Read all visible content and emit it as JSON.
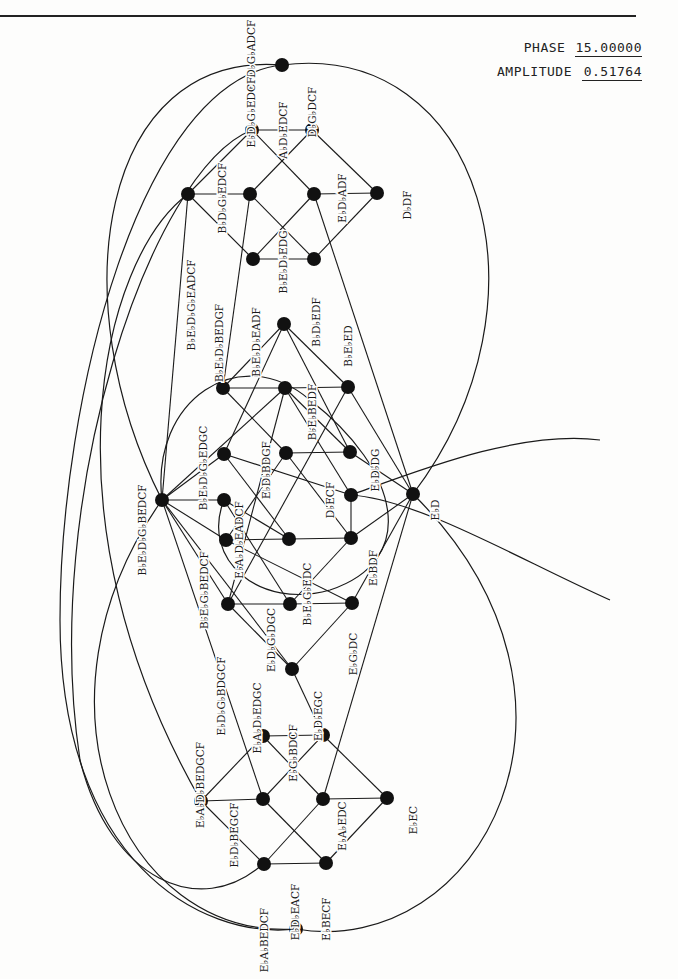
{
  "header": {
    "phase_label": "PHASE",
    "phase_value": "15.00000",
    "amplitude_label": "AMPLITUDE",
    "amplitude_value": "0.51764"
  },
  "diagram": {
    "title": "",
    "colors": {
      "ink": "#1a1a1a",
      "node": "#111111",
      "paper": "#fdfdfc"
    },
    "node_radius": 7,
    "nodes": [
      {
        "id": "T0",
        "x": 282,
        "y": 65
      },
      {
        "id": "T1",
        "x": 252,
        "y": 130
      },
      {
        "id": "T2",
        "x": 312,
        "y": 130
      },
      {
        "id": "T3",
        "x": 188,
        "y": 194
      },
      {
        "id": "T4",
        "x": 250,
        "y": 194
      },
      {
        "id": "T5",
        "x": 314,
        "y": 194
      },
      {
        "id": "T6",
        "x": 377,
        "y": 193
      },
      {
        "id": "T7",
        "x": 253,
        "y": 259
      },
      {
        "id": "T8",
        "x": 314,
        "y": 259
      },
      {
        "id": "M0",
        "x": 284,
        "y": 324
      },
      {
        "id": "M1",
        "x": 223,
        "y": 388
      },
      {
        "id": "M2",
        "x": 285,
        "y": 388
      },
      {
        "id": "M3",
        "x": 348,
        "y": 387
      },
      {
        "id": "M4",
        "x": 224,
        "y": 454
      },
      {
        "id": "M5",
        "x": 286,
        "y": 453
      },
      {
        "id": "M6",
        "x": 350,
        "y": 452
      },
      {
        "id": "L",
        "x": 162,
        "y": 500
      },
      {
        "id": "M7",
        "x": 224,
        "y": 500
      },
      {
        "id": "M8",
        "x": 351,
        "y": 495
      },
      {
        "id": "R",
        "x": 413,
        "y": 494
      },
      {
        "id": "M9",
        "x": 226,
        "y": 540
      },
      {
        "id": "M10",
        "x": 289,
        "y": 539
      },
      {
        "id": "M11",
        "x": 351,
        "y": 538
      },
      {
        "id": "M12",
        "x": 228,
        "y": 604
      },
      {
        "id": "M13",
        "x": 290,
        "y": 604
      },
      {
        "id": "M14",
        "x": 352,
        "y": 603
      },
      {
        "id": "M15",
        "x": 292,
        "y": 669
      },
      {
        "id": "B0",
        "x": 263,
        "y": 736
      },
      {
        "id": "B1",
        "x": 323,
        "y": 735
      },
      {
        "id": "B2",
        "x": 201,
        "y": 801
      },
      {
        "id": "B3",
        "x": 263,
        "y": 799
      },
      {
        "id": "B4",
        "x": 323,
        "y": 799
      },
      {
        "id": "B5",
        "x": 387,
        "y": 798
      },
      {
        "id": "B6",
        "x": 264,
        "y": 864
      },
      {
        "id": "B7",
        "x": 326,
        "y": 863
      },
      {
        "id": "B8",
        "x": 296,
        "y": 929
      }
    ],
    "edges": [
      [
        "T1",
        "T2"
      ],
      [
        "T1",
        "T3"
      ],
      [
        "T1",
        "T5"
      ],
      [
        "T2",
        "T4"
      ],
      [
        "T2",
        "T6"
      ],
      [
        "T3",
        "T4"
      ],
      [
        "T3",
        "T7"
      ],
      [
        "T4",
        "T8"
      ],
      [
        "T5",
        "T6"
      ],
      [
        "T5",
        "T7"
      ],
      [
        "T6",
        "T8"
      ],
      [
        "T7",
        "T8"
      ],
      [
        "T4",
        "M1"
      ],
      [
        "T5",
        "R"
      ],
      [
        "T3",
        "L"
      ],
      [
        "M0",
        "M1"
      ],
      [
        "M0",
        "M3"
      ],
      [
        "M0",
        "M4"
      ],
      [
        "M0",
        "M6"
      ],
      [
        "M1",
        "M2"
      ],
      [
        "M1",
        "M5"
      ],
      [
        "M2",
        "M3"
      ],
      [
        "M2",
        "M6"
      ],
      [
        "M2",
        "M8"
      ],
      [
        "M3",
        "R"
      ],
      [
        "M3",
        "M12"
      ],
      [
        "M4",
        "L"
      ],
      [
        "M4",
        "M8"
      ],
      [
        "M4",
        "M10"
      ],
      [
        "M5",
        "M6"
      ],
      [
        "M5",
        "M9"
      ],
      [
        "M5",
        "M11"
      ],
      [
        "M6",
        "R"
      ],
      [
        "M7",
        "L"
      ],
      [
        "M7",
        "M10"
      ],
      [
        "M7",
        "M13"
      ],
      [
        "M8",
        "M11"
      ],
      [
        "M9",
        "L"
      ],
      [
        "M9",
        "M10"
      ],
      [
        "M9",
        "M14"
      ],
      [
        "M10",
        "M11"
      ],
      [
        "M11",
        "R"
      ],
      [
        "M11",
        "M13"
      ],
      [
        "M12",
        "M13"
      ],
      [
        "M12",
        "M15"
      ],
      [
        "M12",
        "M2"
      ],
      [
        "M13",
        "M14"
      ],
      [
        "M14",
        "M15"
      ],
      [
        "M14",
        "R"
      ],
      [
        "L",
        "M12"
      ],
      [
        "L",
        "M15"
      ],
      [
        "L",
        "M2"
      ],
      [
        "M15",
        "B1"
      ],
      [
        "L",
        "B3"
      ],
      [
        "R",
        "B4"
      ],
      [
        "B0",
        "B1"
      ],
      [
        "B0",
        "B2"
      ],
      [
        "B0",
        "B4"
      ],
      [
        "B1",
        "B3"
      ],
      [
        "B1",
        "B5"
      ],
      [
        "B2",
        "B3"
      ],
      [
        "B2",
        "B6"
      ],
      [
        "B3",
        "B7"
      ],
      [
        "B4",
        "B5"
      ],
      [
        "B4",
        "B6"
      ],
      [
        "B5",
        "B7"
      ],
      [
        "B6",
        "B7"
      ]
    ],
    "arcs": [
      {
        "d": "M 282 65 C 480 40, 560 300, 413 494"
      },
      {
        "d": "M 282 65 C 100 50, 60 300, 162 500"
      },
      {
        "d": "M 282 65 C 140 80, 60 400, 60 620 C 60 860, 200 940, 296 929"
      },
      {
        "d": "M 296 929 C 480 960, 620 700, 413 494"
      },
      {
        "d": "M 296 929 C 120 940, 20 700, 162 500"
      },
      {
        "d": "M 252 130 C 150 170, 40 500, 80 760 C 110 880, 200 920, 263 864"
      },
      {
        "d": "M 188 194 C 100 260, 40 520, 201 801"
      },
      {
        "d": "M 162 500 C 150 400, 240 340, 310 400 C 400 470, 420 560, 330 590 C 260 610, 200 560, 224 500"
      },
      {
        "d": "M 351 495 C 420 470, 520 430, 600 440"
      },
      {
        "d": "M 351 495 C 420 500, 520 560, 610 600"
      }
    ],
    "labels": [
      {
        "text": "E♭D♭G♭ADCF",
        "x": 255,
        "y": 55,
        "rot": -90
      },
      {
        "text": "E♭D♭G♭EDCF",
        "x": 255,
        "y": 112,
        "rot": -90
      },
      {
        "text": "A♭D♭EDCF",
        "x": 287,
        "y": 130,
        "rot": -90
      },
      {
        "text": "D♭G♭DCF",
        "x": 316,
        "y": 112,
        "rot": -90
      },
      {
        "text": "B♭D♭G♭EDCF",
        "x": 226,
        "y": 198,
        "rot": -90
      },
      {
        "text": "E♭D♭ADF",
        "x": 346,
        "y": 198,
        "rot": -90
      },
      {
        "text": "D♭DF",
        "x": 411,
        "y": 205,
        "rot": -90
      },
      {
        "text": "B♭E♭D♭G♭EADCF",
        "x": 195,
        "y": 305,
        "rot": -90
      },
      {
        "text": "B♭E♭D♭EDG",
        "x": 287,
        "y": 262,
        "rot": -90
      },
      {
        "text": "B♭E♭D♭BEDGF",
        "x": 223,
        "y": 343,
        "rot": -90
      },
      {
        "text": "B♭E♭D♭EADF",
        "x": 260,
        "y": 342,
        "rot": -90
      },
      {
        "text": "B♭D♭EDF",
        "x": 320,
        "y": 322,
        "rot": -90
      },
      {
        "text": "B♭E♭ED",
        "x": 352,
        "y": 346,
        "rot": -90
      },
      {
        "text": "B♭E♭BEDF",
        "x": 316,
        "y": 412,
        "rot": -90
      },
      {
        "text": "B♭E♭D♭G♭EDGC",
        "x": 207,
        "y": 468,
        "rot": -90
      },
      {
        "text": "E♭D♭BDGF",
        "x": 270,
        "y": 470,
        "rot": -90
      },
      {
        "text": "E♭D♭DG",
        "x": 379,
        "y": 470,
        "rot": -90
      },
      {
        "text": "B♭E♭D♭G♭BEDCF",
        "x": 146,
        "y": 530,
        "rot": -90
      },
      {
        "text": "E♭A♭D♭EADCF",
        "x": 243,
        "y": 540,
        "rot": -90
      },
      {
        "text": "D♭ECF",
        "x": 334,
        "y": 500,
        "rot": -90
      },
      {
        "text": "E♭D",
        "x": 439,
        "y": 510,
        "rot": -90
      },
      {
        "text": "B♭E♭G♭BEDCF",
        "x": 208,
        "y": 590,
        "rot": -90
      },
      {
        "text": "B♭E♭G♭EDC",
        "x": 311,
        "y": 594,
        "rot": -90
      },
      {
        "text": "E♭BDF",
        "x": 377,
        "y": 568,
        "rot": -90
      },
      {
        "text": "E♭D♭G♭DGC",
        "x": 275,
        "y": 640,
        "rot": -90
      },
      {
        "text": "E♭G♭DC",
        "x": 357,
        "y": 654,
        "rot": -90
      },
      {
        "text": "E♭D♭G♭BDGCF",
        "x": 225,
        "y": 696,
        "rot": -90
      },
      {
        "text": "E♭A♭D♭EDGC",
        "x": 261,
        "y": 718,
        "rot": -90
      },
      {
        "text": "E♭D♭EGC",
        "x": 322,
        "y": 716,
        "rot": -90
      },
      {
        "text": "E♭A♭D♭BEDGCF",
        "x": 204,
        "y": 785,
        "rot": -90
      },
      {
        "text": "E♭G♭BDCF",
        "x": 297,
        "y": 753,
        "rot": -90
      },
      {
        "text": "E♭D♭BEGCF",
        "x": 238,
        "y": 835,
        "rot": -90
      },
      {
        "text": "E♭A♭EDC",
        "x": 346,
        "y": 826,
        "rot": -90
      },
      {
        "text": "E♭EC",
        "x": 417,
        "y": 820,
        "rot": -90
      },
      {
        "text": "E♭D♭EACF",
        "x": 299,
        "y": 912,
        "rot": -90
      },
      {
        "text": "E♭BECF",
        "x": 330,
        "y": 919,
        "rot": -90
      },
      {
        "text": "E♭A♭BEDCF",
        "x": 268,
        "y": 940,
        "rot": -90
      }
    ]
  }
}
